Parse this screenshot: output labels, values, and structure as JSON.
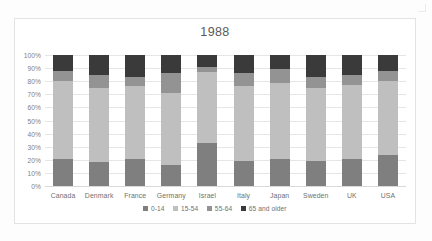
{
  "chart_data": {
    "type": "bar",
    "subtype": "stacked-100-percent",
    "title": "1988",
    "xlabel": "",
    "ylabel": "",
    "ylim": [
      0,
      100
    ],
    "yticks": [
      "0%",
      "10%",
      "20%",
      "30%",
      "40%",
      "50%",
      "60%",
      "70%",
      "80%",
      "90%",
      "100%"
    ],
    "ytick_values": [
      0,
      10,
      20,
      30,
      40,
      50,
      60,
      70,
      80,
      90,
      100
    ],
    "grid": true,
    "legend_position": "bottom",
    "categories": [
      "Canada",
      "Denmark",
      "France",
      "Germany",
      "Israel",
      "Italy",
      "Japan",
      "Sweden",
      "UK",
      "USA"
    ],
    "series": [
      {
        "name": "0-14",
        "color": "#7F7F7F",
        "values": [
          21,
          18,
          21,
          16,
          33,
          19,
          21,
          19,
          21,
          24
        ]
      },
      {
        "name": "15-54",
        "color": "#BFBFBF",
        "values": [
          59,
          57,
          55,
          55,
          54,
          57,
          58,
          56,
          56,
          56
        ]
      },
      {
        "name": "55-64",
        "color": "#939393",
        "values": [
          8,
          10,
          7,
          15,
          4,
          10,
          10,
          8,
          8,
          8
        ]
      },
      {
        "name": "65 and older",
        "color": "#3A3A3A",
        "values": [
          12,
          15,
          17,
          14,
          9,
          14,
          11,
          17,
          15,
          12
        ]
      }
    ]
  },
  "chart": {
    "title": "1988"
  }
}
